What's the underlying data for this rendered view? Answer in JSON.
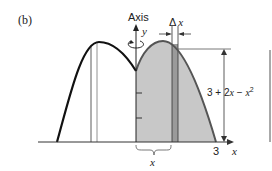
{
  "figure": {
    "panel_label": "(b)",
    "axis_label": "Axis",
    "axis_variable": "y",
    "strip_width_label": "Δ x",
    "height_expression_base": "3 + 2",
    "height_expression_x": "x",
    "height_expression_mid": " − ",
    "height_expression_x2": "x",
    "height_expression_exp": "2",
    "x_tick_label": "3",
    "x_axis_label": "x",
    "brace_label": "x"
  },
  "colors": {
    "curve": "#111111",
    "shade": "#c8c8c8",
    "strip": "#9a9a9a",
    "outline": "#555555",
    "line": "#333333"
  }
}
